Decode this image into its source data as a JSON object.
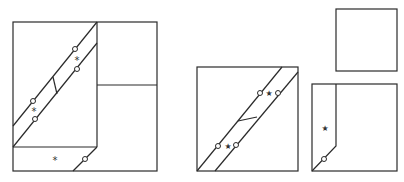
{
  "diagram": {
    "title": "",
    "colors": {
      "line": "#2a2a2a",
      "marker": "#333333",
      "background": "#ffffff"
    },
    "figures": [
      {
        "id": "figure-left",
        "label": "square with diagonal band and folded flap",
        "markers": [
          {
            "type": "asterisk",
            "glyph": "*",
            "x": 77,
            "y": 60
          },
          {
            "type": "asterisk",
            "glyph": "*",
            "x": 34,
            "y": 111
          },
          {
            "type": "asterisk",
            "glyph": "*",
            "x": 55,
            "y": 159
          }
        ]
      },
      {
        "id": "figure-middle",
        "label": "square with diagonal band",
        "markers": [
          {
            "type": "star",
            "glyph": "★",
            "x": 269,
            "y": 93
          },
          {
            "type": "star",
            "glyph": "★",
            "x": 228,
            "y": 146
          }
        ]
      },
      {
        "id": "figure-top-right",
        "label": "small empty square"
      },
      {
        "id": "figure-bottom-right",
        "label": "square with strip and corner cut",
        "markers": [
          {
            "type": "star",
            "glyph": "★",
            "x": 325,
            "y": 128
          }
        ]
      }
    ]
  }
}
